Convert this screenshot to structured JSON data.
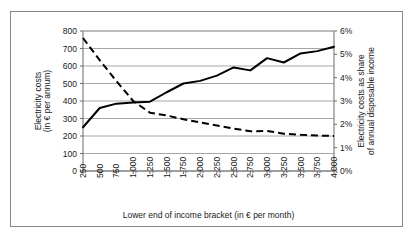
{
  "chart_data": {
    "type": "line",
    "title": "",
    "xlabel": "Lower end of income bracket (in € per month)",
    "ylabel": "Electricity costs\n(in € per annum)",
    "ylabel_line1": "Electricity costs",
    "ylabel_line2": "(in € per annum)",
    "y2label_line1": "Electricity costs as share",
    "y2label_line2": "of annual disposable income",
    "grid": true,
    "legend": "none",
    "categories": [
      "250",
      "500",
      "750",
      "1,000",
      "1,250",
      "1,500",
      "1,750",
      "2,000",
      "2,250",
      "2,500",
      "2,750",
      "3,000",
      "3,250",
      "3,500",
      "3,750",
      "4,000"
    ],
    "x_tick_labels": [
      "250",
      "500",
      "750",
      "1,000",
      "1,250",
      "1,500",
      "1,750",
      "2,000",
      "2,250",
      "2,500",
      "2,750",
      "3,000",
      "3,250",
      "3,500",
      "3,750",
      "4,000"
    ],
    "y_tick_labels": [
      "0",
      "100",
      "200",
      "300",
      "400",
      "500",
      "600",
      "700",
      "800"
    ],
    "y_tick_values": [
      0,
      100,
      200,
      300,
      400,
      500,
      600,
      700,
      800
    ],
    "ylim": [
      0,
      800
    ],
    "y2_tick_labels": [
      "0%",
      "1%",
      "2%",
      "3%",
      "4%",
      "5%",
      "6%"
    ],
    "y2_tick_values": [
      0,
      1,
      2,
      3,
      4,
      5,
      6
    ],
    "y2lim": [
      0,
      6
    ],
    "series": [
      {
        "name": "Electricity costs (in € per annum)",
        "axis": "left",
        "style": "solid",
        "color": "#000000",
        "values": [
          250,
          360,
          385,
          392,
          396,
          450,
          500,
          515,
          545,
          592,
          575,
          645,
          620,
          672,
          685,
          710
        ]
      },
      {
        "name": "Electricity costs as share of annual disposable income",
        "axis": "right",
        "style": "dashed",
        "color": "#000000",
        "values": [
          5.7,
          4.75,
          3.85,
          3.0,
          2.5,
          2.38,
          2.22,
          2.08,
          1.95,
          1.82,
          1.7,
          1.72,
          1.6,
          1.55,
          1.52,
          1.5
        ]
      }
    ]
  },
  "colors": {
    "frame": "#8a8a8a",
    "gridline": "#a6a6a6",
    "axis": "#6b6b6b",
    "series": "#000000",
    "background": "#ffffff"
  }
}
